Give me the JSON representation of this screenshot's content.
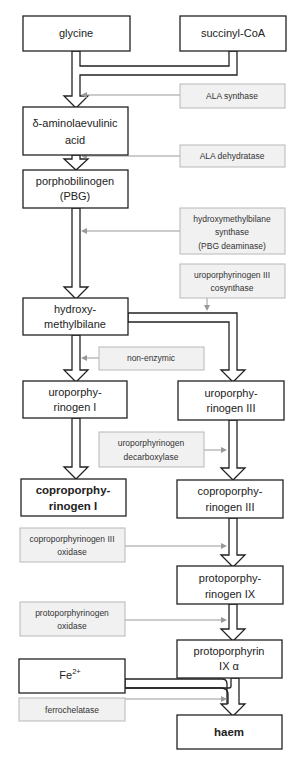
{
  "substrates": {
    "glycine": "glycine",
    "succinyl_coa": "succinyl-CoA",
    "iron": {
      "base": "Fe",
      "superscript": "2+"
    }
  },
  "intermediates": {
    "ala": [
      "δ-aminolaevulinic",
      "acid"
    ],
    "pbg": [
      "porphobilinogen",
      "(PBG)"
    ],
    "hmb": [
      "hydroxy-",
      "methylbilane"
    ],
    "uro1": [
      "uroporphy-",
      "rinogen I"
    ],
    "uro3": [
      "uroporphy-",
      "rinogen III"
    ],
    "copro1": [
      "coproporphy-",
      "rinogen I"
    ],
    "copro3": [
      "coproporphy-",
      "rinogen III"
    ],
    "protogen9": [
      "protoporphy-",
      "rinogen IX"
    ],
    "proto9": [
      "protoporphyrin",
      "IX α"
    ],
    "haem": "haem"
  },
  "enzymes": {
    "ala_synthase": [
      "ALA synthase"
    ],
    "ala_dehydratase": [
      "ALA dehydratase"
    ],
    "hmb_synthase": [
      "hydroxymethylbilane",
      "synthase",
      "(PBG deaminase)"
    ],
    "uro3_cosynthase": [
      "uroporphyrinogen III",
      "cosynthase"
    ],
    "non_enzymic": [
      "non-enzymic"
    ],
    "uro_decarboxylase": [
      "uroporphyrinogen",
      "decarboxylase"
    ],
    "copro3_oxidase": [
      "coproporphyrinogen III",
      "oxidase"
    ],
    "proto_oxidase": [
      "protoporphyrinogen",
      "oxidase"
    ],
    "ferrochelatase": [
      "ferrochelatase"
    ]
  }
}
